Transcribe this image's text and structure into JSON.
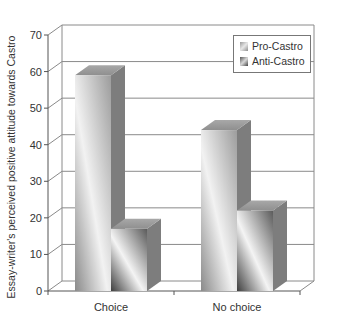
{
  "chart_data": {
    "type": "bar",
    "style": "3d-grouped-bar",
    "title": "",
    "xlabel": "",
    "ylabel": "Essay-writer's perceived positive attitude towards Castro",
    "categories": [
      "Choice",
      "No choice"
    ],
    "series": [
      {
        "name": "Pro-Castro",
        "values": [
          59,
          44
        ]
      },
      {
        "name": "Anti-Castro",
        "values": [
          17,
          22
        ]
      }
    ],
    "ylim": [
      0,
      70
    ],
    "yticks": [
      0,
      10,
      20,
      30,
      40,
      50,
      60,
      70
    ],
    "grid": true,
    "legend_position": "top-right-inside"
  },
  "legend": {
    "items": [
      {
        "label": "Pro-Castro"
      },
      {
        "label": "Anti-Castro"
      }
    ]
  }
}
